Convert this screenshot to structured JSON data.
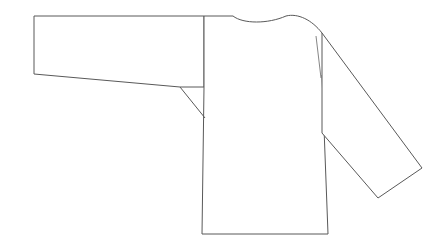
{
  "document": {
    "title": "Garment Technical Line Drawing",
    "kind": "technical-flat-sketch",
    "subject": "long-sleeve shirt / jacket",
    "view": "front flat, left sleeve extended horizontally, right sleeve angled downward",
    "background_color": "#ffffff",
    "line_color": "#595959",
    "seam_line_color": "#777777",
    "line_width_px": 1,
    "canvas": {
      "width": 446,
      "height": 245,
      "units": "pixels"
    }
  },
  "geometry": {
    "left_sleeve": {
      "name": "left-sleeve",
      "description": "rectangular sleeve extended horizontally to the left, cuff at far left, tapering slightly downward toward the body",
      "cuff_edge": {
        "x": 34,
        "y_top": 16,
        "y_bottom": 74
      },
      "outline_points": "34,16 204,16 204,87 180,87 34,74 34,16",
      "top_edge": "34,16 204,16",
      "bottom_edge": "34,74 180,87",
      "underarm_corner": {
        "x": 180,
        "y": 87
      }
    },
    "left_underarm_seam": {
      "name": "left-underarm-seam",
      "description": "short diagonal from the sleeve underarm point down to the body side seam",
      "points": "180,87 205,118"
    },
    "left_shoulder_seam": {
      "name": "left-shoulder-seam",
      "description": "vertical line separating left sleeve from body at the shoulder",
      "points": "204,16 204,87"
    },
    "body": {
      "name": "body-panel",
      "description": "rectangular torso panel with curved neckline at top and straight hem at bottom",
      "left_edge": "204,87 202,234",
      "right_edge": "322,75 328,234",
      "hem": {
        "y": 234,
        "x_left": 202,
        "x_right": 328
      },
      "outline_points": "204,16 204,87 202,234 328,234 322,75 322,33"
    },
    "neckline": {
      "name": "neckline-curve",
      "description": "shallow scooped back/front neckline; flat shoulder to x=233, dips to y=22 near x=256, rises at x=286, then arcs over right shoulder",
      "path": "M 204,16 L 233,16 C 243,24 268,24 286,16 C 298,13 312,20 322,33",
      "shoulder_flat_end": {
        "x": 233,
        "y": 16
      },
      "lowest_point": {
        "x": 256,
        "y": 22
      },
      "right_shoulder_rise": {
        "x": 286,
        "y": 16
      },
      "shoulder_peak": {
        "x": 300,
        "y": 14
      },
      "right_shoulder_point": {
        "x": 322,
        "y": 33
      }
    },
    "right_sleeve": {
      "name": "right-sleeve",
      "description": "sleeve angled down and to the right from the right shoulder, cuff at lower right",
      "outline_points": "322,33 422,168 378,198 322,133",
      "outer_edge": "322,33 422,168",
      "cuff_edge": "422,168 378,198",
      "inner_edge": "378,198 322,133",
      "cuff_far_corner": {
        "x": 422,
        "y": 168
      },
      "cuff_near_corner": {
        "x": 378,
        "y": 198
      },
      "armhole_bottom": {
        "x": 322,
        "y": 133
      }
    },
    "right_shoulder_seam": {
      "name": "right-shoulder-seam",
      "description": "thin near-vertical seam line just inside the right shoulder, from armhole top toward body",
      "points": "316,36 321,78"
    }
  }
}
